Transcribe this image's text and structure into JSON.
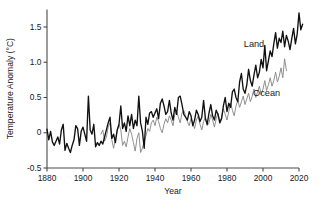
{
  "chart_data": {
    "type": "line",
    "title": "",
    "xlabel": "Year",
    "ylabel": "Temperature Anomaly (°C)",
    "xlim": [
      1880,
      2020
    ],
    "ylim": [
      -0.5,
      1.75
    ],
    "xticks": [
      1880,
      1900,
      1920,
      1940,
      1960,
      1980,
      2000,
      2020
    ],
    "xtick_labels": [
      "1880",
      "1900",
      "1920",
      "1940",
      "1960",
      "1980",
      "2000",
      "2020"
    ],
    "yticks": [
      -0.5,
      0,
      0.5,
      1.0,
      1.5
    ],
    "ytick_labels": [
      "-0.5",
      "0",
      "0.5",
      "1.0",
      "1.5"
    ],
    "grid": false,
    "legend_position": "inline-annotation",
    "spines": [
      "left",
      "bottom"
    ],
    "annotations": [
      {
        "text": "Land",
        "x": 1995,
        "y": 1.22,
        "color": "#111111"
      },
      {
        "text": "Ocean",
        "x": 2002,
        "y": 0.52,
        "color": "#1a1a1a"
      }
    ],
    "series": [
      {
        "name": "Land",
        "color": "#111111",
        "style": "solid",
        "linewidth": 1.35,
        "x_start": 1880,
        "x_end": 2013,
        "values": [
          0.05,
          -0.1,
          0.02,
          -0.13,
          -0.18,
          -0.12,
          -0.06,
          -0.16,
          0.04,
          0.12,
          -0.25,
          -0.15,
          -0.22,
          -0.28,
          -0.18,
          -0.1,
          0.1,
          0.06,
          -0.18,
          0.02,
          0.08,
          -0.02,
          -0.12,
          0.52,
          0.04,
          -0.02,
          0.12,
          -0.2,
          -0.14,
          -0.18,
          -0.12,
          -0.16,
          -0.06,
          0.04,
          0.14,
          0.22,
          -0.08,
          -0.02,
          -0.14,
          0.04,
          0.12,
          0.38,
          0.06,
          0.14,
          0.02,
          0.24,
          0.1,
          0.26,
          0.06,
          0.18,
          0.1,
          0.52,
          0.14,
          0.02,
          -0.22,
          0.22,
          0.12,
          0.28,
          0.3,
          0.22,
          0.28,
          0.34,
          0.2,
          0.42,
          0.48,
          0.38,
          0.26,
          0.3,
          0.46,
          0.28,
          0.18,
          0.36,
          0.26,
          0.5,
          0.52,
          0.4,
          0.26,
          0.22,
          0.18,
          0.3,
          0.24,
          0.1,
          0.18,
          0.32,
          0.26,
          0.16,
          0.22,
          0.46,
          0.2,
          0.12,
          0.28,
          0.4,
          0.24,
          0.18,
          0.32,
          0.26,
          0.14,
          0.2,
          0.38,
          0.5,
          0.3,
          0.42,
          0.36,
          0.58,
          0.62,
          0.5,
          0.44,
          0.72,
          0.84,
          0.62,
          0.56,
          0.68,
          0.9,
          0.74,
          0.66,
          0.82,
          0.96,
          0.78,
          0.86,
          1.04,
          0.92,
          1.24,
          0.88,
          1.02,
          1.16,
          1.08,
          1.26,
          1.42,
          1.2,
          1.34,
          1.28,
          1.44,
          1.22,
          1.38,
          1.3,
          1.18,
          1.34,
          1.48,
          1.26,
          1.4,
          1.7,
          1.46,
          1.54
        ]
      },
      {
        "name": "Ocean",
        "color": "#8a8a8a",
        "style": "solid",
        "linewidth": 0.95,
        "x_start": 1910,
        "x_end": 2013,
        "values": [
          -0.02,
          0.04,
          -0.12,
          -0.06,
          0.08,
          0.14,
          -0.1,
          -0.22,
          -0.08,
          0.02,
          0.12,
          0.04,
          -0.18,
          -0.12,
          -0.2,
          -0.06,
          0.06,
          -0.02,
          -0.14,
          -0.26,
          -0.08,
          0.0,
          -0.28,
          -0.22,
          -0.12,
          -0.04,
          0.06,
          0.02,
          0.14,
          0.18,
          0.1,
          0.22,
          0.16,
          0.06,
          0.0,
          0.12,
          0.2,
          0.14,
          0.24,
          0.18,
          0.1,
          0.26,
          0.3,
          0.22,
          0.14,
          0.28,
          0.32,
          0.24,
          0.16,
          0.1,
          0.2,
          0.14,
          0.06,
          0.18,
          0.24,
          0.12,
          0.04,
          0.16,
          0.22,
          0.1,
          0.14,
          0.26,
          0.18,
          0.08,
          0.2,
          0.28,
          0.16,
          0.22,
          0.34,
          0.26,
          0.18,
          0.3,
          0.42,
          0.32,
          0.24,
          0.38,
          0.46,
          0.36,
          0.44,
          0.52,
          0.4,
          0.48,
          0.56,
          0.44,
          0.52,
          0.62,
          0.5,
          0.58,
          0.66,
          0.54,
          0.62,
          0.74,
          0.6,
          0.68,
          0.78,
          0.66,
          0.74,
          0.86,
          0.72,
          0.8,
          0.92,
          0.78,
          1.05,
          0.88
        ]
      }
    ]
  }
}
